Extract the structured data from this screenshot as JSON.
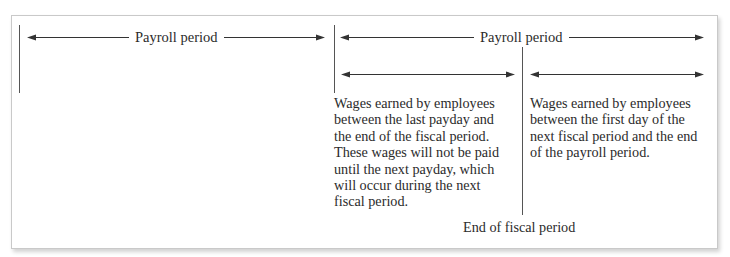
{
  "diagram": {
    "left_period": {
      "label": "Payroll period"
    },
    "right_period": {
      "label": "Payroll period"
    },
    "accrued_segment": {
      "lines": [
        "Wages earned by employees",
        "between the last payday and",
        "the end of the fiscal period.",
        "These wages will not be paid",
        "until the next payday, which",
        "will occur during the next",
        "fiscal period."
      ]
    },
    "next_segment": {
      "lines": [
        "Wages earned by employees",
        "between the first day of the",
        "next fiscal period and the end",
        "of the payroll period."
      ]
    },
    "fiscal_boundary": {
      "label": "End of fiscal period"
    },
    "colors": {
      "line": "#555555",
      "arrow": "#333333",
      "text": "#2b2b2b",
      "border": "#c9c9c9"
    }
  }
}
